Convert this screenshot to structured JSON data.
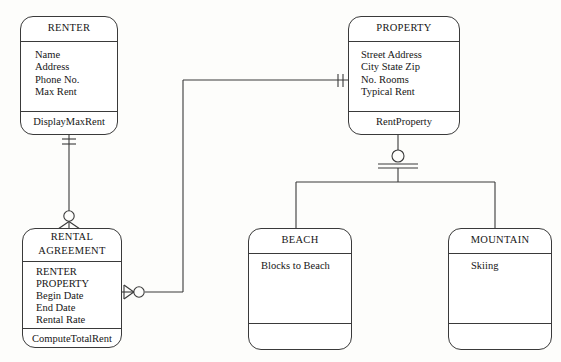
{
  "diagram": {
    "notation": "IDEF1X crow's foot",
    "background_color": "#fdfdfb",
    "line_color": "#3a3a3a",
    "text_color": "#161616"
  },
  "entities": [
    {
      "id": "renter",
      "name": "RENTER",
      "title_lines": [
        "RENTER"
      ],
      "attributes": [
        "Name",
        "Address",
        "Phone No.",
        "Max Rent"
      ],
      "operations": [
        "DisplayMaxRent"
      ],
      "operations_text": "DisplayMaxRent",
      "box": {
        "x": 20,
        "y": 16,
        "w": 98,
        "h": 119
      },
      "title_h": 20,
      "ops_h": 19
    },
    {
      "id": "property",
      "name": "PROPERTY",
      "title_lines": [
        "PROPERTY"
      ],
      "attributes": [
        "Street Address",
        "City State Zip",
        "No. Rooms",
        "Typical Rent"
      ],
      "operations": [
        "RentProperty"
      ],
      "operations_text": "RentProperty",
      "box": {
        "x": 348,
        "y": 16,
        "w": 112,
        "h": 119
      },
      "title_h": 20,
      "ops_h": 19
    },
    {
      "id": "rental-agreement",
      "name": "RENTAL AGREEMENT",
      "title_lines": [
        "RENTAL",
        "AGREEMENT"
      ],
      "attributes": [
        "RENTER",
        "PROPERTY",
        "Begin Date",
        "End Date",
        "Rental Rate"
      ],
      "operations": [
        "ComputeTotalRent"
      ],
      "operations_text": "ComputeTotalRent",
      "box": {
        "x": 22,
        "y": 228,
        "w": 100,
        "h": 120
      },
      "title_h": 29,
      "ops_h": 19
    },
    {
      "id": "beach",
      "name": "BEACH",
      "title_lines": [
        "BEACH"
      ],
      "attributes": [
        "Blocks to Beach"
      ],
      "operations": [],
      "operations_text": "",
      "box": {
        "x": 248,
        "y": 228,
        "w": 104,
        "h": 122
      },
      "title_h": 20,
      "ops_h": 22
    },
    {
      "id": "mountain",
      "name": "MOUNTAIN",
      "title_lines": [
        "MOUNTAIN"
      ],
      "attributes": [
        "Skiing"
      ],
      "operations": [],
      "operations_text": "",
      "box": {
        "x": 448,
        "y": 228,
        "w": 104,
        "h": 122
      },
      "title_h": 20,
      "ops_h": 22
    }
  ],
  "relationships": [
    {
      "id": "renter-rental",
      "from": "renter",
      "to": "rental-agreement",
      "from_cardinality": "exactly-one",
      "to_cardinality": "zero-or-more",
      "from_marker": "double-tick",
      "to_marker": "circle-crowsfoot"
    },
    {
      "id": "property-rental",
      "from": "property",
      "to": "rental-agreement",
      "from_cardinality": "exactly-one",
      "to_cardinality": "zero-or-more",
      "from_marker": "double-tick",
      "to_marker": "circle-crowsfoot"
    },
    {
      "id": "property-subtypes",
      "from": "property",
      "to": [
        "beach",
        "mountain"
      ],
      "type": "generalization",
      "marker": "circle-over-bar"
    }
  ]
}
